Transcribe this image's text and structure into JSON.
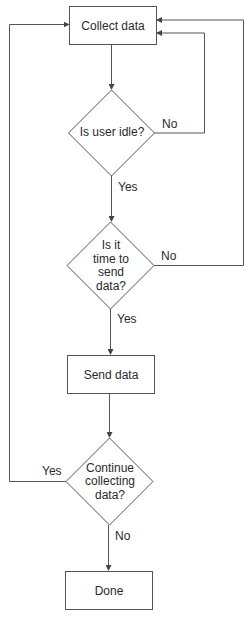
{
  "diagram": {
    "type": "flowchart",
    "colors": {
      "line": "#555555",
      "text": "#2a2a2a",
      "background": "#ffffff"
    },
    "nodes": [
      {
        "id": "collect",
        "shape": "process",
        "label": "Collect data"
      },
      {
        "id": "idle",
        "shape": "decision",
        "label_lines": [
          "Is user idle?"
        ]
      },
      {
        "id": "time",
        "shape": "decision",
        "label_lines": [
          "Is it",
          "time to",
          "send",
          "data?"
        ]
      },
      {
        "id": "send",
        "shape": "process",
        "label": "Send data"
      },
      {
        "id": "continue",
        "shape": "decision",
        "label_lines": [
          "Continue",
          "collecting",
          "data?"
        ]
      },
      {
        "id": "done",
        "shape": "process",
        "label": "Done"
      }
    ],
    "edges": [
      {
        "from": "collect",
        "to": "idle",
        "label": ""
      },
      {
        "from": "idle",
        "to": "collect",
        "label": "No"
      },
      {
        "from": "idle",
        "to": "time",
        "label": "Yes"
      },
      {
        "from": "time",
        "to": "collect",
        "label": "No"
      },
      {
        "from": "time",
        "to": "send",
        "label": "Yes"
      },
      {
        "from": "send",
        "to": "continue",
        "label": ""
      },
      {
        "from": "continue",
        "to": "collect",
        "label": "Yes"
      },
      {
        "from": "continue",
        "to": "done",
        "label": "No"
      }
    ],
    "edge_labels": {
      "idle_no": "No",
      "idle_yes": "Yes",
      "time_no": "No",
      "time_yes": "Yes",
      "continue_yes": "Yes",
      "continue_no": "No"
    }
  }
}
